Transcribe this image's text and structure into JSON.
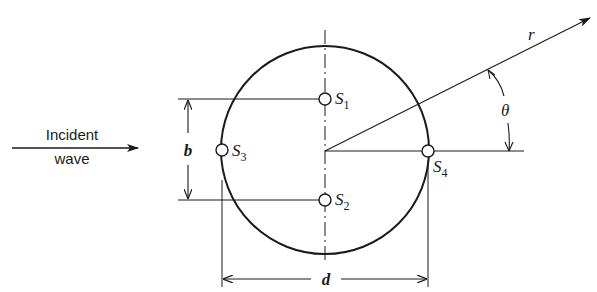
{
  "diagram": {
    "incident_wave": {
      "line1": "Incident",
      "line2": "wave"
    },
    "sources": [
      {
        "id": "S1",
        "letter": "S",
        "sub": "1"
      },
      {
        "id": "S2",
        "letter": "S",
        "sub": "2"
      },
      {
        "id": "S3",
        "letter": "S",
        "sub": "3"
      },
      {
        "id": "S4",
        "letter": "S",
        "sub": "4"
      }
    ],
    "dimensions": {
      "b": "b",
      "d": "d"
    },
    "radius_label": "r",
    "angle_label": "θ",
    "colors": {
      "stroke": "#1a1a1a",
      "background": "#ffffff"
    }
  }
}
